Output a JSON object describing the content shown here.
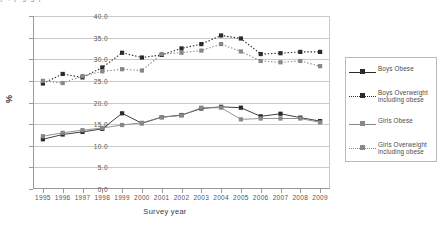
{
  "clipped_top_text": "y   ,        p        g      g    p",
  "chart_data": {
    "type": "line",
    "title": "",
    "xlabel": "Survey year",
    "ylabel": "%",
    "categories": [
      "1995",
      "1996",
      "1997",
      "1998",
      "1999",
      "2000",
      "2001",
      "2002",
      "2003",
      "2004",
      "2005",
      "2006",
      "2007",
      "2008",
      "2009"
    ],
    "ylim": [
      0,
      40
    ],
    "yticks": [
      "0.0",
      "5.0",
      "10.0",
      "15.0",
      "20.0",
      "25.0",
      "30.0",
      "35.0",
      "40.0"
    ],
    "ytick_values": [
      0,
      5,
      10,
      15,
      20,
      25,
      30,
      35,
      40
    ],
    "grid": true,
    "legend_position": "right",
    "series": [
      {
        "name": "Boys Obese",
        "marker": "square",
        "line": "solid",
        "color": "#2b2b2b",
        "values": [
          11.5,
          12.6,
          13.2,
          13.9,
          17.5,
          15.2,
          16.6,
          17.1,
          18.6,
          19.0,
          18.8,
          16.8,
          17.4,
          16.5,
          15.7
        ]
      },
      {
        "name": "Boys Overweight including obese",
        "marker": "square",
        "line": "dotted",
        "color": "#2b2b2b",
        "values": [
          24.4,
          26.6,
          25.8,
          28.1,
          31.5,
          30.4,
          31.0,
          32.5,
          33.5,
          35.5,
          34.8,
          31.2,
          31.4,
          31.7,
          31.7
        ]
      },
      {
        "name": "Girls Obese",
        "marker": "square",
        "line": "solid",
        "color": "#888888",
        "values": [
          12.2,
          13.0,
          13.6,
          14.1,
          14.8,
          15.3,
          16.6,
          17.0,
          18.8,
          18.8,
          16.1,
          16.3,
          16.3,
          16.3,
          15.4
        ]
      },
      {
        "name": "Girls Overweight including obese",
        "marker": "square",
        "line": "dotted",
        "color": "#888888",
        "values": [
          25.0,
          24.5,
          26.1,
          27.2,
          27.7,
          27.4,
          31.2,
          31.5,
          32.0,
          33.5,
          31.8,
          29.6,
          29.3,
          29.6,
          28.4
        ]
      }
    ]
  }
}
